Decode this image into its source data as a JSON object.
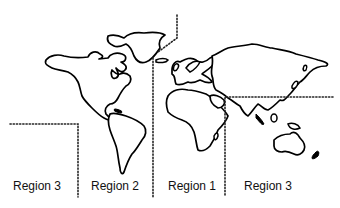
{
  "map": {
    "type": "world-region-map",
    "outline_color": "#000000",
    "background_color": "#ffffff",
    "boundary_style": "dotted",
    "regions": [
      {
        "label": "Region 3",
        "area": "Pacific / western Americas edge"
      },
      {
        "label": "Region 2",
        "area": "Americas"
      },
      {
        "label": "Region 1",
        "area": "Europe / Africa"
      },
      {
        "label": "Region 3",
        "area": "Asia / Oceania"
      }
    ]
  }
}
